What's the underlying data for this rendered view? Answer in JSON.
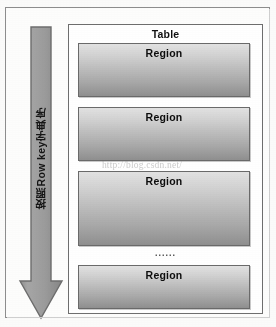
{
  "figure": {
    "arrow": {
      "label": "按照Row key字典序",
      "direction": "down",
      "color": "#9a9a9a",
      "border_color": "#6d6d6d"
    },
    "table_panel": {
      "title": "Table",
      "border_color": "#6e6e6e",
      "background": "#ffffff"
    },
    "regions": [
      {
        "label": "Region"
      },
      {
        "label": "Region"
      },
      {
        "label": "Region"
      },
      {
        "label": "Region"
      }
    ],
    "ellipsis": "......",
    "watermark": "http://blog.csdn.net/",
    "colors": {
      "region_gradient_top": "#e2e2e2",
      "region_gradient_bottom": "#8f8f8f",
      "region_border": "#6a6a6a",
      "page_background": "#fbfbfa",
      "outer_frame_border": "#8d8d8d",
      "text": "#101010"
    }
  }
}
